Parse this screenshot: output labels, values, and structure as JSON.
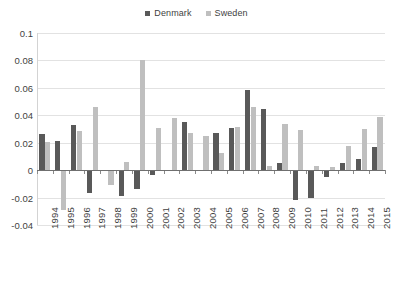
{
  "chart_data": {
    "type": "bar",
    "title": "",
    "subtitle": "",
    "xlabel": "",
    "ylabel": "",
    "ylim": [
      -0.04,
      0.1
    ],
    "ytick_labels": [
      "0.1",
      "0.08",
      "0.06",
      "0.04",
      "0.02",
      "0",
      "-0.02",
      "-0.04"
    ],
    "ytick_values": [
      0.1,
      0.08,
      0.06,
      0.04,
      0.02,
      0,
      -0.02,
      -0.04
    ],
    "grid": true,
    "legend_position": "top-center",
    "categories": [
      "1994",
      "1995",
      "1996",
      "1997",
      "1998",
      "1999",
      "2000",
      "2001",
      "2002",
      "2003",
      "2004",
      "2005",
      "2006",
      "2007",
      "2008",
      "2009",
      "2010",
      "2011",
      "2012",
      "2013",
      "2014",
      "2015"
    ],
    "series": [
      {
        "name": "Denmark",
        "color": "#595959",
        "values": [
          0.0265,
          0.0215,
          0.033,
          -0.0168,
          0.0,
          -0.0192,
          -0.0136,
          -0.0035,
          0.0004,
          0.035,
          0.0,
          0.0268,
          0.0305,
          0.0588,
          0.0445,
          0.0053,
          -0.0215,
          -0.0203,
          -0.0047,
          0.005,
          0.008,
          0.017
        ]
      },
      {
        "name": "Sweden",
        "color": "#bfbfbf",
        "values": [
          0.0205,
          -0.0288,
          0.0288,
          0.0462,
          -0.0108,
          0.0058,
          0.0805,
          0.0305,
          0.038,
          0.0272,
          0.0248,
          0.0128,
          0.0312,
          0.0462,
          0.0028,
          0.0335,
          0.0292,
          0.003,
          0.0022,
          0.0178,
          0.03,
          0.039
        ]
      }
    ]
  },
  "legend": {
    "entries": [
      {
        "label": "Denmark",
        "color": "#595959"
      },
      {
        "label": "Sweden",
        "color": "#bfbfbf"
      }
    ]
  }
}
